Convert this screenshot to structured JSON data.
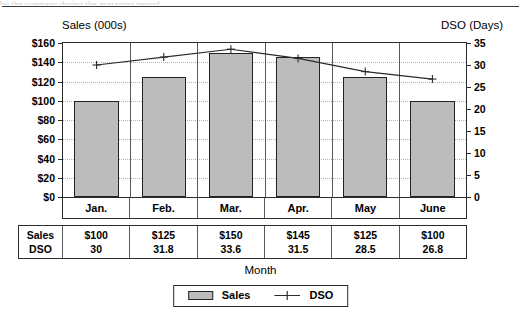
{
  "top_sliver_text": "by  the  company  during  the  averaging  period.",
  "chart_data": {
    "type": "bar",
    "title": "",
    "subtitle": "",
    "xlabel": "Month",
    "categories": [
      "Jan.",
      "Feb.",
      "Mar.",
      "Apr.",
      "May",
      "June"
    ],
    "grid": true,
    "legend_position": "bottom-center",
    "axes": {
      "left": {
        "label": "Sales (000s)",
        "ticks": [
          "$0",
          "$20",
          "$40",
          "$60",
          "$80",
          "$100",
          "$120",
          "$140",
          "$160"
        ],
        "tick_values": [
          0,
          20,
          40,
          60,
          80,
          100,
          120,
          140,
          160
        ],
        "min": 0,
        "max": 160
      },
      "right": {
        "label": "DSO (Days)",
        "ticks": [
          "0",
          "5",
          "10",
          "15",
          "20",
          "25",
          "30",
          "35"
        ],
        "tick_values": [
          0,
          5,
          10,
          15,
          20,
          25,
          30,
          35
        ],
        "min": 0,
        "max": 35
      }
    },
    "series": [
      {
        "name": "Sales",
        "kind": "bar",
        "axis": "left",
        "color": "#bcbcbc",
        "values": [
          100,
          125,
          150,
          145,
          125,
          100
        ],
        "labels": [
          "$100",
          "$125",
          "$150",
          "$145",
          "$125",
          "$100"
        ]
      },
      {
        "name": "DSO",
        "kind": "line",
        "axis": "right",
        "color": "#2b2b2b",
        "marker": "plus",
        "values": [
          30,
          31.8,
          33.6,
          31.5,
          28.5,
          26.8
        ],
        "labels": [
          "30",
          "31.8",
          "33.6",
          "31.5",
          "28.5",
          "26.8"
        ]
      }
    ]
  },
  "table": {
    "row_headers": [
      "Sales",
      "DSO"
    ],
    "columns": [
      "Jan.",
      "Feb.",
      "Mar.",
      "Apr.",
      "May",
      "June"
    ],
    "rows": [
      {
        "header": "Sales",
        "cells": [
          "$100",
          "$125",
          "$150",
          "$145",
          "$125",
          "$100"
        ]
      },
      {
        "header": "DSO",
        "cells": [
          "30",
          "31.8",
          "33.6",
          "31.5",
          "28.5",
          "26.8"
        ]
      }
    ]
  },
  "legend": {
    "items": [
      {
        "label": "Sales",
        "marker": "swatch",
        "color": "#bcbcbc"
      },
      {
        "label": "DSO",
        "marker": "line-plus",
        "color": "#2b2b2b"
      }
    ]
  }
}
